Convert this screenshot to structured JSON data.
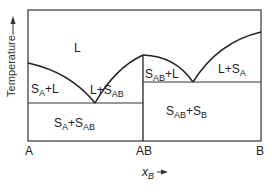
{
  "diagram": {
    "type": "binary phase diagram with congruent compound",
    "y_axis_label": "Temperature",
    "x_axis_variable": "x",
    "x_axis_variable_sub": "B",
    "x_ticks": [
      "A",
      "AB",
      "B"
    ],
    "regions": {
      "liquid": "L",
      "sa_l": {
        "s": "S",
        "sub": "A",
        "rest": "+L"
      },
      "l_sab": {
        "pre": "L+S",
        "sub": "AB"
      },
      "sab_l": {
        "s": "S",
        "sub": "AB",
        "rest": "+L"
      },
      "l_sa": {
        "pre": "L+S",
        "sub": "A"
      },
      "sa_sab": {
        "s": "S",
        "sub1": "A",
        "mid": "+S",
        "sub2": "AB"
      },
      "sab_sb": {
        "s": "S",
        "sub1": "AB",
        "mid": "+S",
        "sub2": "B"
      }
    },
    "line_color": "#222222"
  }
}
